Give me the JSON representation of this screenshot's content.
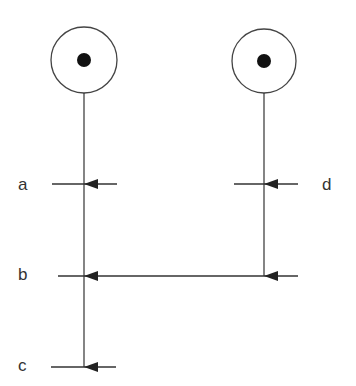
{
  "diagram": {
    "type": "petri-net",
    "places": [
      {
        "id": "p1",
        "cx": 84,
        "cy": 60,
        "r": 33,
        "tokens": 1
      },
      {
        "id": "p2",
        "cx": 264,
        "cy": 61,
        "r": 32,
        "tokens": 1
      }
    ],
    "transitions": [
      {
        "label": "a",
        "x1": 52,
        "x2": 117,
        "y": 184,
        "label_x": 30,
        "label_y": 176
      },
      {
        "label": "d",
        "x1": 234,
        "x2": 298,
        "y": 184,
        "label_x": 323,
        "label_y": 176
      },
      {
        "label": "b",
        "x1": 58,
        "x2": 298,
        "y": 276,
        "label_x": 20,
        "label_y": 267
      },
      {
        "label": "c",
        "x1": 51,
        "x2": 116,
        "y": 367,
        "label_x": 20,
        "label_y": 358
      }
    ],
    "arcs": [
      {
        "from": "p1",
        "to": "a"
      },
      {
        "from": "p2",
        "to": "d"
      },
      {
        "from": "a",
        "to": "b"
      },
      {
        "from": "d",
        "to": "b"
      },
      {
        "from": "b",
        "to": "c"
      }
    ],
    "colors": {
      "stroke": "#333333",
      "token": "#111111",
      "background": "#ffffff"
    }
  }
}
